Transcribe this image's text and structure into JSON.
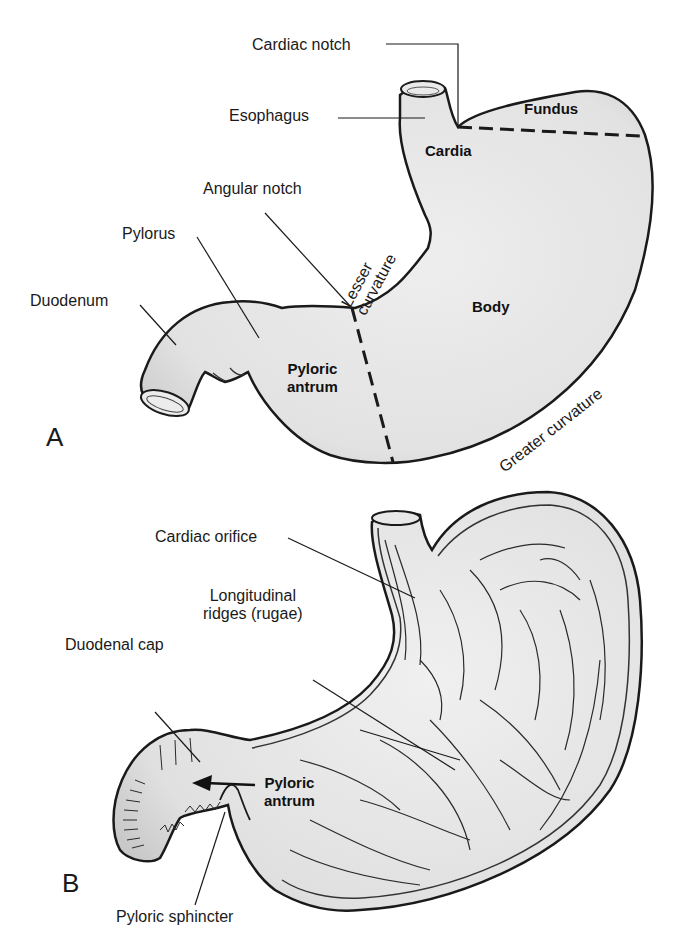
{
  "figure": {
    "panel_a": {
      "label": "A",
      "callouts": {
        "cardiac_notch": "Cardiac notch",
        "esophagus": "Esophagus",
        "angular_notch": "Angular notch",
        "pylorus": "Pylorus",
        "duodenum": "Duodenum"
      },
      "regions": {
        "fundus": "Fundus",
        "cardia": "Cardia",
        "body": "Body",
        "pyloric_antrum_line1": "Pyloric",
        "pyloric_antrum_line2": "antrum"
      },
      "curvatures": {
        "lesser_line1": "Lesser",
        "lesser_line2": "curvature",
        "greater": "Greater curvature"
      }
    },
    "panel_b": {
      "label": "B",
      "callouts": {
        "cardiac_orifice": "Cardiac orifice",
        "rugae_line1": "Longitudinal",
        "rugae_line2": "ridges (rugae)",
        "duodenal_cap": "Duodenal cap",
        "pyloric_sphincter": "Pyloric sphincter"
      },
      "regions": {
        "pyloric_antrum_line1": "Pyloric",
        "pyloric_antrum_line2": "antrum"
      }
    },
    "colors": {
      "fill": "#e4e4e4",
      "outline": "#1a1a1a",
      "background": "#ffffff"
    }
  }
}
